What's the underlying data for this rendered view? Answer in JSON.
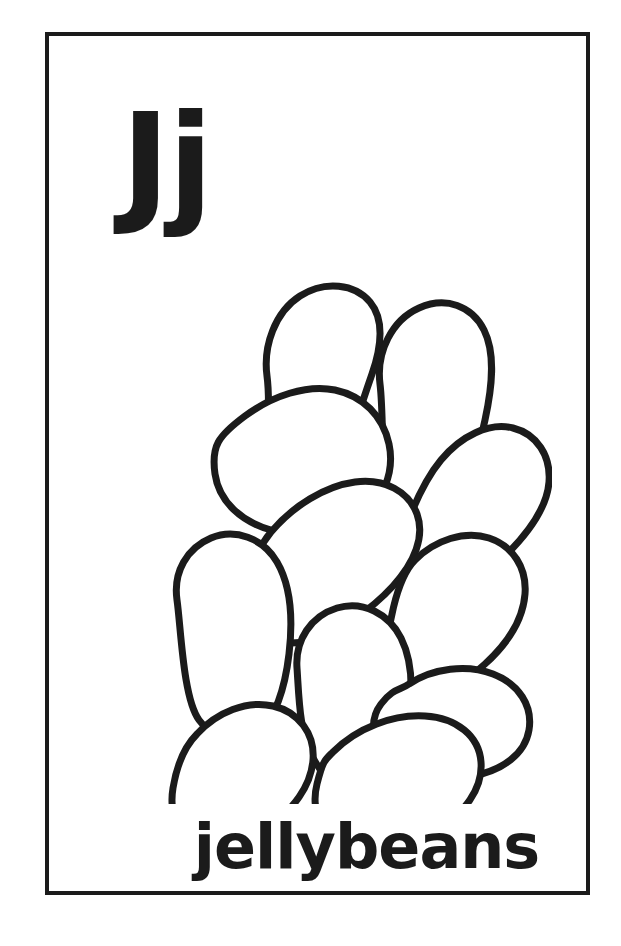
{
  "card": {
    "letter_pair": "Jj",
    "uppercase_letter": "J",
    "lowercase_letter": "j",
    "caption": "jellybeans",
    "subject": "jellybeans",
    "style": "black-and-white line-art coloring flashcard",
    "ink_color": "#1b1b1b",
    "paper_color": "#ffffff",
    "border_color": "#1b1b1b",
    "border_width_px": 4
  },
  "illustration": {
    "name": "jellybeans-illustration",
    "description": "A pile of eleven overlapping oval jellybean outlines",
    "bean_count": 11,
    "stroke_color": "#1b1b1b",
    "fill_color": "#ffffff",
    "stroke_width": 7,
    "beans": [
      {
        "id": "bean-top-left",
        "label": "top left jellybean, upright oval"
      },
      {
        "id": "bean-top-right",
        "label": "top right jellybean, upright oval"
      },
      {
        "id": "bean-upper-left",
        "label": "upper left jellybean, tilted kidney"
      },
      {
        "id": "bean-right-upper",
        "label": "upper right jellybean, diagonal oval"
      },
      {
        "id": "bean-center",
        "label": "center jellybean, diagonal oval"
      },
      {
        "id": "bean-right-middle",
        "label": "right middle jellybean, diagonal oval"
      },
      {
        "id": "bean-left-middle",
        "label": "left middle jellybean, upright oval"
      },
      {
        "id": "bean-center-lower",
        "label": "lower center jellybean, upright oval"
      },
      {
        "id": "bean-right-lower",
        "label": "lower right jellybean, horizontal oval"
      },
      {
        "id": "bean-bottom-left",
        "label": "bottom left jellybean, tilted oval"
      },
      {
        "id": "bean-bottom-center",
        "label": "bottom center jellybean, horizontal oval"
      }
    ]
  }
}
